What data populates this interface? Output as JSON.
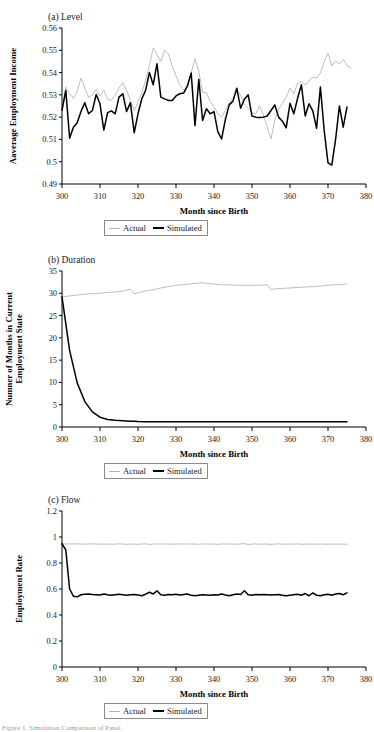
{
  "figure": {
    "caption": "Figure 1. Simulation Comparison of Panel"
  },
  "legend": {
    "actual_label": "Actual",
    "simulated_label": "Simulated",
    "actual_color": "#b5b5b5",
    "simulated_color": "#000000"
  },
  "panels": [
    {
      "id": "level",
      "title": "(a) Level"
    },
    {
      "id": "duration",
      "title": "(b) Duration"
    },
    {
      "id": "flow",
      "title": "(c) Flow"
    }
  ],
  "chart_data": [
    {
      "type": "line",
      "title": "(a) Level",
      "xlabel": "Month since Birth",
      "ylabel": "Aaverage Employment Income",
      "xlim": [
        300,
        380
      ],
      "ylim": [
        0.49,
        0.56
      ],
      "xticks": [
        300,
        310,
        320,
        330,
        340,
        350,
        360,
        370,
        380
      ],
      "yticks": [
        0.49,
        0.5,
        0.51,
        0.52,
        0.53,
        0.54,
        0.55,
        0.56
      ],
      "ytick_labels": [
        "0.49",
        "0.5",
        "0.51",
        "0.52",
        "0.53",
        "0.54",
        "0.55",
        "0.56"
      ],
      "grid": false,
      "legend_position": "below",
      "x": [
        300,
        301,
        302,
        303,
        304,
        305,
        306,
        307,
        308,
        309,
        310,
        311,
        312,
        313,
        314,
        315,
        316,
        317,
        318,
        319,
        320,
        321,
        322,
        323,
        324,
        325,
        326,
        327,
        328,
        329,
        330,
        331,
        332,
        333,
        334,
        335,
        336,
        337,
        338,
        339,
        340,
        341,
        342,
        343,
        344,
        345,
        346,
        347,
        348,
        349,
        350,
        351,
        352,
        353,
        354,
        355,
        356,
        357,
        358,
        359,
        360,
        361,
        362,
        363,
        364,
        365,
        366,
        367,
        368,
        369,
        370,
        371,
        372,
        373,
        374,
        375,
        376
      ],
      "series": [
        {
          "name": "Actual",
          "color": "#b5b5b5",
          "values": [
            0.5225,
            0.5335,
            0.5305,
            0.5285,
            0.5315,
            0.5375,
            0.533,
            0.529,
            0.53,
            0.5325,
            0.5295,
            0.532,
            0.528,
            0.5275,
            0.53,
            0.533,
            0.5355,
            0.532,
            0.5275,
            0.523,
            0.5268,
            0.531,
            0.5365,
            0.5432,
            0.551,
            0.548,
            0.545,
            0.55,
            0.5485,
            0.543,
            0.5385,
            0.5345,
            0.532,
            0.5335,
            0.54,
            0.5462,
            0.5405,
            0.531,
            0.531,
            0.527,
            0.5245,
            0.5215,
            0.52,
            0.523,
            0.5265,
            0.5285,
            0.532,
            0.53,
            0.5255,
            0.524,
            0.522,
            0.5215,
            0.525,
            0.521,
            0.5155,
            0.5102,
            0.5185,
            0.5235,
            0.5262,
            0.529,
            0.533,
            0.5305,
            0.5352,
            0.536,
            0.5345,
            0.5362,
            0.538,
            0.5375,
            0.5398,
            0.545,
            0.5488,
            0.543,
            0.5452,
            0.5438,
            0.546,
            0.5432,
            0.542
          ]
        },
        {
          "name": "Simulated",
          "color": "#000000",
          "values": [
            0.523,
            0.532,
            0.5105,
            0.5155,
            0.5175,
            0.5225,
            0.5265,
            0.5215,
            0.523,
            0.5302,
            0.526,
            0.5142,
            0.522,
            0.5228,
            0.5215,
            0.529,
            0.5305,
            0.5225,
            0.5265,
            0.513,
            0.5215,
            0.5282,
            0.532,
            0.54,
            0.5345,
            0.544,
            0.529,
            0.5282,
            0.5275,
            0.5275,
            0.5295,
            0.5305,
            0.5308,
            0.534,
            0.5398,
            0.5162,
            0.537,
            0.5185,
            0.5238,
            0.5215,
            0.5225,
            0.5135,
            0.5102,
            0.519,
            0.5255,
            0.5272,
            0.533,
            0.524,
            0.528,
            0.53,
            0.5205,
            0.52,
            0.5198,
            0.52,
            0.5205,
            0.523,
            0.5255,
            0.52,
            0.5182,
            0.5152,
            0.5262,
            0.5215,
            0.5285,
            0.5345,
            0.5205,
            0.526,
            0.5228,
            0.515,
            0.5335,
            0.514,
            0.4995,
            0.4985,
            0.51,
            0.525,
            0.5155,
            0.5245
          ]
        }
      ]
    },
    {
      "type": "line",
      "title": "(b) Duration",
      "xlabel": "Month since Birth",
      "ylabel": "Numner of Months in Current Employment State",
      "xlim": [
        300,
        380
      ],
      "ylim": [
        0,
        35
      ],
      "xticks": [
        300,
        310,
        320,
        330,
        340,
        350,
        360,
        370,
        380
      ],
      "yticks": [
        0,
        5,
        10,
        15,
        20,
        25,
        30,
        35
      ],
      "ytick_labels": [
        "0",
        "5",
        "10",
        "15",
        "20",
        "25",
        "30",
        "35"
      ],
      "grid": false,
      "legend_position": "below",
      "x": [
        300,
        302,
        304,
        306,
        308,
        310,
        312,
        314,
        316,
        318,
        319,
        320,
        322,
        324,
        326,
        328,
        330,
        332,
        334,
        336,
        337,
        338,
        340,
        342,
        344,
        346,
        348,
        350,
        352,
        354,
        355,
        356,
        358,
        360,
        362,
        364,
        366,
        368,
        370,
        372,
        374,
        375
      ],
      "series": [
        {
          "name": "Actual",
          "color": "#b5b5b5",
          "values": [
            29.2,
            29.4,
            29.6,
            29.8,
            29.9,
            30.0,
            30.2,
            30.3,
            30.5,
            30.9,
            29.9,
            30.1,
            30.5,
            30.8,
            31.2,
            31.5,
            31.8,
            31.9,
            32.1,
            32.3,
            32.4,
            32.2,
            32.1,
            31.9,
            31.9,
            31.8,
            31.8,
            31.8,
            31.8,
            31.9,
            30.8,
            31.0,
            31.1,
            31.2,
            31.3,
            31.4,
            31.5,
            31.6,
            31.8,
            31.9,
            32.0,
            32.1
          ]
        },
        {
          "name": "Simulated",
          "color": "#000000",
          "values": [
            29.2,
            17.2,
            9.9,
            5.7,
            3.4,
            2.2,
            1.7,
            1.5,
            1.4,
            1.3,
            1.3,
            1.25,
            1.2,
            1.2,
            1.18,
            1.18,
            1.17,
            1.17,
            1.16,
            1.16,
            1.16,
            1.16,
            1.16,
            1.15,
            1.15,
            1.15,
            1.15,
            1.15,
            1.15,
            1.15,
            1.15,
            1.15,
            1.15,
            1.15,
            1.15,
            1.15,
            1.15,
            1.15,
            1.15,
            1.15,
            1.15,
            1.15
          ]
        }
      ]
    },
    {
      "type": "line",
      "title": "(c) Flow",
      "xlabel": "Month since Birth",
      "ylabel": "Employment Rate",
      "xlim": [
        300,
        380
      ],
      "ylim": [
        0,
        1.2
      ],
      "xticks": [
        300,
        310,
        320,
        330,
        340,
        350,
        360,
        370,
        380
      ],
      "yticks": [
        0,
        0.2,
        0.4,
        0.6,
        0.8,
        1,
        1.2
      ],
      "ytick_labels": [
        "0",
        "0.2",
        "0.4",
        "0.6",
        "0.8",
        "1",
        "1.2"
      ],
      "grid": false,
      "legend_position": "below",
      "x": [
        300,
        301,
        302,
        303,
        304,
        305,
        306,
        307,
        308,
        309,
        310,
        311,
        312,
        313,
        314,
        315,
        316,
        317,
        318,
        319,
        320,
        321,
        322,
        323,
        324,
        325,
        326,
        327,
        328,
        329,
        330,
        331,
        332,
        333,
        334,
        335,
        336,
        337,
        338,
        339,
        340,
        341,
        342,
        343,
        344,
        345,
        346,
        347,
        348,
        349,
        350,
        351,
        352,
        353,
        354,
        355,
        356,
        357,
        358,
        359,
        360,
        361,
        362,
        363,
        364,
        365,
        366,
        367,
        368,
        369,
        370,
        371,
        372,
        373,
        374,
        375
      ],
      "series": [
        {
          "name": "Actual",
          "color": "#b5b5b5",
          "values": [
            0.948,
            0.946,
            0.947,
            0.946,
            0.947,
            0.946,
            0.945,
            0.946,
            0.947,
            0.946,
            0.945,
            0.946,
            0.945,
            0.944,
            0.946,
            0.947,
            0.946,
            0.944,
            0.945,
            0.946,
            0.944,
            0.946,
            0.948,
            0.942,
            0.947,
            0.946,
            0.945,
            0.947,
            0.946,
            0.945,
            0.946,
            0.947,
            0.945,
            0.946,
            0.947,
            0.945,
            0.944,
            0.946,
            0.947,
            0.945,
            0.946,
            0.944,
            0.946,
            0.947,
            0.945,
            0.946,
            0.944,
            0.947,
            0.948,
            0.943,
            0.945,
            0.947,
            0.944,
            0.946,
            0.945,
            0.943,
            0.946,
            0.947,
            0.945,
            0.944,
            0.946,
            0.945,
            0.947,
            0.944,
            0.946,
            0.945,
            0.947,
            0.944,
            0.946,
            0.945,
            0.944,
            0.946,
            0.945,
            0.946,
            0.944,
            0.945
          ]
        },
        {
          "name": "Simulated",
          "color": "#000000",
          "values": [
            0.948,
            0.9,
            0.6,
            0.545,
            0.54,
            0.556,
            0.56,
            0.562,
            0.558,
            0.556,
            0.554,
            0.562,
            0.556,
            0.552,
            0.556,
            0.56,
            0.556,
            0.552,
            0.556,
            0.558,
            0.554,
            0.548,
            0.56,
            0.575,
            0.562,
            0.586,
            0.556,
            0.552,
            0.558,
            0.556,
            0.56,
            0.554,
            0.558,
            0.562,
            0.552,
            0.548,
            0.552,
            0.556,
            0.554,
            0.552,
            0.556,
            0.554,
            0.562,
            0.554,
            0.548,
            0.556,
            0.562,
            0.558,
            0.586,
            0.556,
            0.552,
            0.558,
            0.556,
            0.558,
            0.556,
            0.554,
            0.556,
            0.558,
            0.552,
            0.548,
            0.552,
            0.556,
            0.56,
            0.552,
            0.565,
            0.548,
            0.57,
            0.552,
            0.548,
            0.556,
            0.56,
            0.552,
            0.562,
            0.566,
            0.556,
            0.57
          ]
        }
      ]
    }
  ]
}
